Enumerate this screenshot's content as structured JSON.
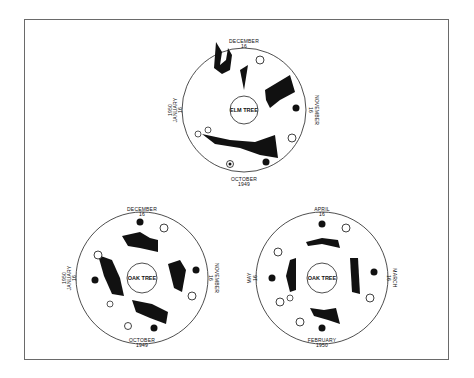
{
  "figure": {
    "dials": [
      {
        "id": "elm",
        "center_label": "ELM TREE",
        "top_label": {
          "month": "DECEMBER",
          "day": "16"
        },
        "left_label": {
          "year": "1950",
          "month": "JANUARY",
          "day": "16"
        },
        "right_label": {
          "month": "NOVEMBER",
          "day": "16"
        },
        "bottom_label": {
          "month": "OCTOBER",
          "year": "1949"
        },
        "bottom_days": [
          "1",
          "4",
          "7",
          "10",
          "13",
          "16",
          "19",
          "22",
          "25",
          "28",
          "31"
        ],
        "rim_ticks": [
          "31",
          "1",
          "31",
          "1",
          "30",
          "1"
        ],
        "legend_symbols": [
          "moon-phase-icons"
        ],
        "colors": {
          "ink": "#111111",
          "paper": "#ffffff"
        }
      },
      {
        "id": "oak-1949",
        "center_label": "OAK TREE",
        "top_label": {
          "month": "DECEMBER",
          "day": "16"
        },
        "left_label": {
          "year": "1950",
          "month": "JANUARY",
          "day": "16"
        },
        "right_label": {
          "month": "NOVEMBER",
          "day": "16"
        },
        "bottom_label": {
          "month": "OCTOBER",
          "year": "1949"
        },
        "bottom_days": [
          "1",
          "4",
          "7",
          "10",
          "13",
          "16",
          "19",
          "22",
          "25",
          "28",
          "31"
        ],
        "rim_ticks": [
          "31",
          "1",
          "31",
          "1",
          "30",
          "1"
        ]
      },
      {
        "id": "oak-1950",
        "center_label": "OAK TREE",
        "top_label": {
          "month": "APRIL",
          "day": "16"
        },
        "left_label": {
          "month": "MAY",
          "day": "16"
        },
        "right_label": {
          "month": "MARCH",
          "day": "16"
        },
        "bottom_label": {
          "month": "FEBRUARY",
          "year": "1950"
        },
        "bottom_days": [
          "1",
          "4",
          "7",
          "10",
          "13",
          "16",
          "19",
          "22",
          "25",
          "28"
        ],
        "rim_ticks": [
          "30",
          "1",
          "31",
          "1",
          "28",
          "1"
        ]
      }
    ]
  }
}
